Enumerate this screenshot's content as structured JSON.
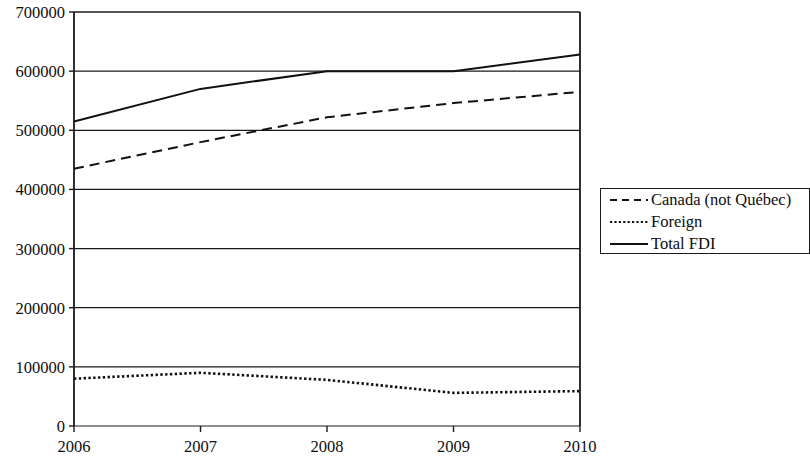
{
  "chart_data": {
    "type": "line",
    "title": "",
    "xlabel": "",
    "ylabel": "",
    "x": [
      2006,
      2007,
      2008,
      2009,
      2010
    ],
    "categories": [
      "2006",
      "2007",
      "2008",
      "2009",
      "2010"
    ],
    "xtick_labels": [
      "2006",
      "2007",
      "2008",
      "2009",
      "2010"
    ],
    "ytick_labels": [
      "0",
      "100000",
      "200000",
      "300000",
      "400000",
      "500000",
      "600000",
      "700000"
    ],
    "ytick_values": [
      0,
      100000,
      200000,
      300000,
      400000,
      500000,
      600000,
      700000
    ],
    "ylim": [
      0,
      700000
    ],
    "xlim": [
      2006,
      2010
    ],
    "grid": "horizontal",
    "legend_position": "right",
    "series": [
      {
        "name": "Canada (not Québec)",
        "style": "dashed",
        "color": "#111111",
        "values": [
          435000,
          480000,
          522000,
          546000,
          565000
        ]
      },
      {
        "name": "Foreign",
        "style": "dotted",
        "color": "#111111",
        "values": [
          80000,
          90000,
          78000,
          56000,
          59000
        ]
      },
      {
        "name": "Total FDI",
        "style": "solid",
        "color": "#111111",
        "values": [
          515000,
          570000,
          600000,
          600000,
          628000
        ]
      }
    ]
  },
  "legend": {
    "entries": [
      {
        "label": "Canada (not Québec)",
        "style": "dashed"
      },
      {
        "label": "Foreign",
        "style": "dotted"
      },
      {
        "label": "Total FDI",
        "style": "solid"
      }
    ]
  }
}
